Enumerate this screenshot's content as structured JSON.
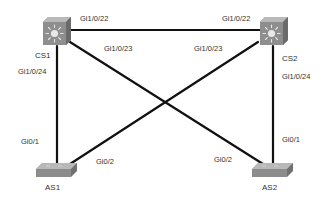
{
  "devices": {
    "cs1": {
      "name": "CS1",
      "type": "multilayer-switch"
    },
    "cs2": {
      "name": "CS2",
      "type": "multilayer-switch"
    },
    "as1": {
      "name": "AS1",
      "type": "access-switch"
    },
    "as2": {
      "name": "AS2",
      "type": "access-switch"
    }
  },
  "links": [
    {
      "from": "CS1",
      "from_port": "Gi1/0/22",
      "to": "CS2",
      "to_port": "Gi1/0/22"
    },
    {
      "from": "CS1",
      "from_port": "Gi1/0/23",
      "to": "AS2",
      "to_port": "Gi0/2"
    },
    {
      "from": "CS2",
      "from_port": "Gi1/0/23",
      "to": "AS1",
      "to_port": "Gi0/2"
    },
    {
      "from": "CS1",
      "from_port": "Gi1/0/24",
      "to": "AS1",
      "to_port": "Gi0/1"
    },
    {
      "from": "CS2",
      "from_port": "Gi1/0/24",
      "to": "AS2",
      "to_port": "Gi0/1"
    }
  ],
  "labels": {
    "cs1_gi22": "Gi1/0/22",
    "cs1_gi23": "Gi1/0/23",
    "cs1_gi24": "Gi1/0/24",
    "cs2_gi22": "Gi1/0/22",
    "cs2_gi23": "Gi1/0/23",
    "cs2_gi24": "Gi1/0/24",
    "as1_gi01": "Gi0/1",
    "as1_gi02": "Gi0/2",
    "as2_gi01": "Gi0/1",
    "as2_gi02": "Gi0/2"
  },
  "colors": {
    "link": "#111111",
    "switch_body": "#8a8a8a",
    "switch_top": "#b5b5b5",
    "label": "#333333"
  }
}
